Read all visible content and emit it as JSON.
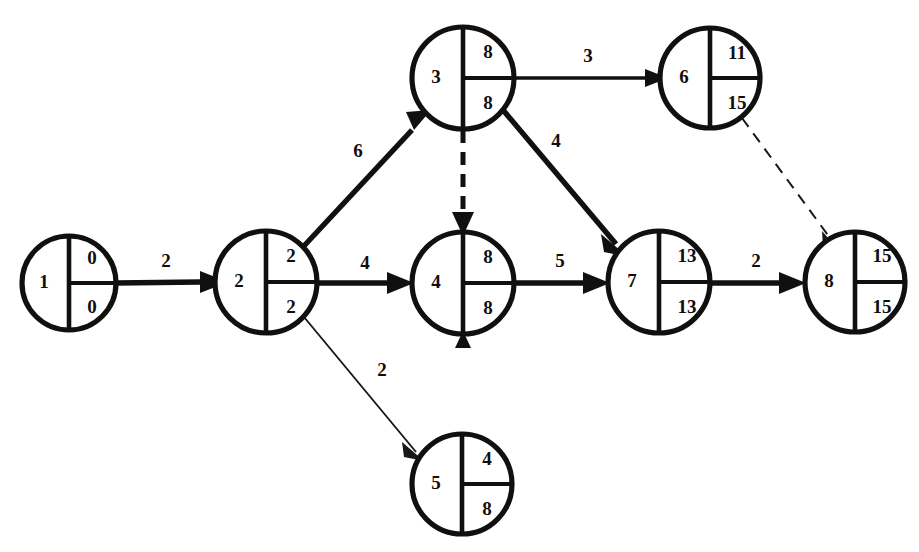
{
  "diagram": {
    "type": "cpm-event-network",
    "canvas": {
      "width": 919,
      "height": 552
    },
    "colors": {
      "ink": "#12100f",
      "background": "#ffffff"
    },
    "nodes": [
      {
        "id": "n1",
        "label": "1",
        "early": "0",
        "late": "0",
        "cx": 69,
        "cy": 283,
        "r": 47
      },
      {
        "id": "n2",
        "label": "2",
        "early": "2",
        "late": "2",
        "cx": 266,
        "cy": 282,
        "r": 51
      },
      {
        "id": "n3",
        "label": "3",
        "early": "8",
        "late": "8",
        "cx": 463,
        "cy": 78,
        "r": 51
      },
      {
        "id": "n4",
        "label": "4",
        "early": "8",
        "late": "8",
        "cx": 463,
        "cy": 283,
        "r": 51
      },
      {
        "id": "n5",
        "label": "5",
        "early": "4",
        "late": "8",
        "cx": 462,
        "cy": 484,
        "r": 50
      },
      {
        "id": "n6",
        "label": "6",
        "early": "11",
        "late": "15",
        "cx": 710,
        "cy": 78,
        "r": 50
      },
      {
        "id": "n7",
        "label": "7",
        "early": "13",
        "late": "13",
        "cx": 659,
        "cy": 282,
        "r": 51
      },
      {
        "id": "n8",
        "label": "8",
        "early": "15",
        "late": "15",
        "cx": 855,
        "cy": 282,
        "r": 50
      }
    ],
    "edges": [
      {
        "id": "e1-2",
        "from": "n1",
        "to": "n2",
        "label": "2",
        "style": "thick",
        "label_x": 166,
        "label_y": 263
      },
      {
        "id": "e2-3",
        "from": "n2",
        "to": "n3",
        "label": "6",
        "style": "thick",
        "label_x": 358,
        "label_y": 153
      },
      {
        "id": "e2-4",
        "from": "n2",
        "to": "n4",
        "label": "4",
        "style": "thick",
        "label_x": 365,
        "label_y": 265
      },
      {
        "id": "e2-5",
        "from": "n2",
        "to": "n5",
        "label": "2",
        "style": "thin",
        "label_x": 382,
        "label_y": 372
      },
      {
        "id": "e3-6",
        "from": "n3",
        "to": "n6",
        "label": "3",
        "style": "medium",
        "label_x": 588,
        "label_y": 60
      },
      {
        "id": "e3-7",
        "from": "n3",
        "to": "n7",
        "label": "4",
        "style": "thick",
        "label_x": 556,
        "label_y": 143
      },
      {
        "id": "e3-4",
        "from": "n3",
        "to": "n4",
        "label": "",
        "style": "dashed-thick",
        "label_x": 0,
        "label_y": 0
      },
      {
        "id": "e4-7",
        "from": "n4",
        "to": "n7",
        "label": "5",
        "style": "thick",
        "label_x": 560,
        "label_y": 263
      },
      {
        "id": "e7-8",
        "from": "n7",
        "to": "n8",
        "label": "2",
        "style": "thick",
        "label_x": 756,
        "label_y": 263
      },
      {
        "id": "e6-8",
        "from": "n6",
        "to": "n8",
        "label": "",
        "style": "dashed-thin",
        "label_x": 0,
        "label_y": 0
      }
    ],
    "node_count": 8,
    "edge_count": 10
  }
}
